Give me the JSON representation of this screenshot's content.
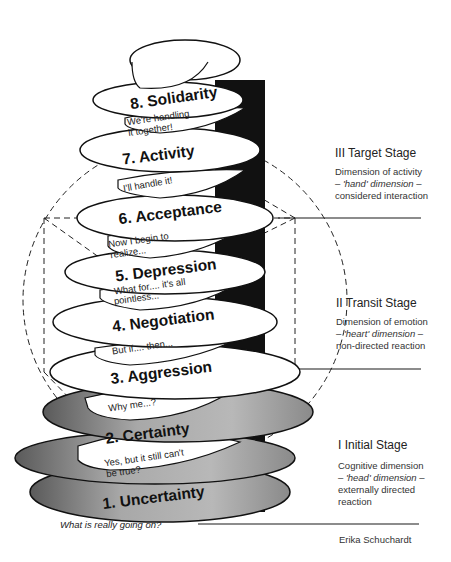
{
  "diagram": {
    "author": "Erika Schuchardt",
    "bottom_question": "What is really going on?",
    "colors": {
      "coil_white": "#ffffff",
      "coil_grey": "#9a9a9a",
      "shadow": "#111111",
      "line": "#1a1a1a"
    },
    "phases": [
      {
        "number": 1,
        "label": "1. Uncertainty",
        "quote_line1": "Yes, but it still can't",
        "quote_line2": "be true?"
      },
      {
        "number": 2,
        "label": "2. Certainty",
        "quote_line1": "Why me...?",
        "quote_line2": ""
      },
      {
        "number": 3,
        "label": "3. Aggression",
        "quote_line1": "But if.... then...",
        "quote_line2": ""
      },
      {
        "number": 4,
        "label": "4. Negotiation",
        "quote_line1": "What for.... it's all",
        "quote_line2": "pointless..."
      },
      {
        "number": 5,
        "label": "5. Depression",
        "quote_line1": "Now I begin to",
        "quote_line2": "realize..."
      },
      {
        "number": 6,
        "label": "6. Acceptance",
        "quote_line1": "I'll handle it!",
        "quote_line2": ""
      },
      {
        "number": 7,
        "label": "7. Activity",
        "quote_line1": "We're handling",
        "quote_line2": "it together!"
      },
      {
        "number": 8,
        "label": "8. Solidarity",
        "quote_line1": "",
        "quote_line2": ""
      }
    ],
    "stages": [
      {
        "title": "III Target Stage",
        "desc_line1": "Dimension of activity",
        "desc_line2_prefix": "– ",
        "desc_line2_italic": "'hand' dimension",
        "desc_line2_suffix": " –",
        "desc_line3": "considered interaction"
      },
      {
        "title": "II Transit Stage",
        "desc_line1": "Dimension of emotion",
        "desc_line2_prefix": "– ",
        "desc_line2_italic": "'heart' dimension",
        "desc_line2_suffix": " –",
        "desc_line3": "non-directed reaction"
      },
      {
        "title": "I Initial Stage",
        "desc_line1": "Cognitive dimension",
        "desc_line2_prefix": "– ",
        "desc_line2_italic": "'head' dimension",
        "desc_line2_suffix": " –",
        "desc_line3": "externally directed",
        "desc_line4": "reaction"
      }
    ]
  }
}
